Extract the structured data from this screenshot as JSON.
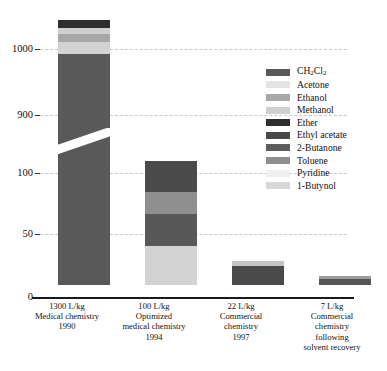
{
  "chart_data": {
    "type": "bar",
    "title": "",
    "subtitle": "",
    "xlabel": "",
    "ylabel": "",
    "stacked": true,
    "grid": true,
    "legend_position": "right",
    "broken_axis": true,
    "axis_note": "Y axis is broken: lower segment spans 0-100, upper segment spans 900-1050",
    "ylim_lower": [
      0,
      100
    ],
    "ylim_upper": [
      900,
      1050
    ],
    "ytick_labels": [
      "1000",
      "900",
      "100",
      "50",
      "0"
    ],
    "ytick_values": [
      1000,
      900,
      100,
      50,
      0
    ],
    "categories": [
      "1300 L/kg Medical chemistry 1990",
      "100 L/kg Optimized medical chemistry 1994",
      "22 L/kg Commercial chemistry 1997",
      "7 L/kg Commercial chemistry following solvent recovery"
    ],
    "category_totals": [
      1300,
      100,
      22,
      7
    ],
    "units": "L/kg",
    "series": [
      {
        "name": "CH2Cl2",
        "label": "CH₂Cl₂",
        "color": "#595959",
        "values": [
          1000,
          0,
          18,
          0
        ]
      },
      {
        "name": "Acetone",
        "label": "Acetone",
        "color": "#e2e2e2",
        "values": [
          22,
          0,
          0,
          0
        ]
      },
      {
        "name": "Ethanol",
        "label": "Ethanol",
        "color": "#a8a8a8",
        "values": [
          40,
          0,
          0,
          0
        ]
      },
      {
        "name": "Methanol",
        "label": "Methanol",
        "color": "#cfcfcf",
        "values": [
          30,
          0,
          0,
          0
        ]
      },
      {
        "name": "Ether",
        "label": "Ether",
        "color": "#2e2e2e",
        "values": [
          20,
          0,
          0,
          0
        ]
      },
      {
        "name": "Ethyl acetate",
        "label": "Ethyl acetate",
        "color": "#4a4a4a",
        "values": [
          0,
          24,
          0,
          7
        ]
      },
      {
        "name": "2-Butanone",
        "label": "2-Butanone",
        "color": "#626262",
        "values": [
          0,
          0,
          0,
          0
        ]
      },
      {
        "name": "Toluene",
        "label": "Toluene",
        "color": "#8f8f8f",
        "values": [
          0,
          17,
          0,
          0
        ]
      },
      {
        "name": "Pyridine",
        "label": "Pyridine",
        "color": "#efefef",
        "values": [
          0,
          0,
          0,
          0
        ]
      },
      {
        "name": "1-Butynol",
        "label": "1-Butynol",
        "color": "#d8d8d8",
        "values": [
          0,
          30,
          4,
          0
        ]
      }
    ]
  },
  "yaxis": {
    "ticks": [
      {
        "label": "1000",
        "y": 49
      },
      {
        "label": "900",
        "y": 115
      },
      {
        "label": "100",
        "y": 173
      },
      {
        "label": "50",
        "y": 234
      },
      {
        "label": "0",
        "y": 297
      }
    ]
  },
  "bars": [
    {
      "name": "bar-1990",
      "left": 18,
      "width": 52,
      "bottom": 0,
      "top": 20,
      "segments": [
        {
          "series": "Ether",
          "color": "#2e2e2e",
          "top": 20,
          "height": 8
        },
        {
          "series": "Methanol",
          "color": "#cfcfcf",
          "top": 28,
          "height": 6
        },
        {
          "series": "Ethanol",
          "color": "#a8a8a8",
          "top": 34,
          "height": 8
        },
        {
          "series": "Acetone",
          "color": "#d3d3d3",
          "top": 42,
          "height": 12
        },
        {
          "series": "CH2Cl2",
          "color": "#595959",
          "top": 54,
          "height": 231
        }
      ]
    },
    {
      "name": "bar-1994",
      "left": 105,
      "width": 52,
      "bottom": 0,
      "top": 161,
      "segments": [
        {
          "series": "Ethyl acetate",
          "color": "#4a4a4a",
          "top": 161,
          "height": 31
        },
        {
          "series": "Toluene",
          "color": "#8f8f8f",
          "top": 192,
          "height": 22
        },
        {
          "series": "2-Butanone",
          "color": "#585858",
          "top": 214,
          "height": 32
        },
        {
          "series": "1-Butynol",
          "color": "#d3d3d3",
          "top": 246,
          "height": 39
        }
      ]
    },
    {
      "name": "bar-1997",
      "left": 192,
      "width": 52,
      "bottom": 0,
      "top": 261,
      "segments": [
        {
          "series": "1-Butynol",
          "color": "#c4c4c4",
          "top": 261,
          "height": 5
        },
        {
          "series": "CH2Cl2",
          "color": "#4a4a4a",
          "top": 266,
          "height": 19
        }
      ]
    },
    {
      "name": "bar-recovery",
      "left": 279,
      "width": 52,
      "bottom": 0,
      "top": 276,
      "segments": [
        {
          "series": "Toluene",
          "color": "#9a9a9a",
          "top": 276,
          "height": 3
        },
        {
          "series": "CH2Cl2",
          "color": "#555555",
          "top": 279,
          "height": 6
        }
      ]
    }
  ],
  "gridlines": [
    49,
    115,
    173,
    234
  ],
  "xlabels": [
    {
      "name": "xlabel-1990",
      "left": 24,
      "width": 86,
      "lines": [
        "1300 L/kg",
        "Medical chemistry",
        "1990"
      ]
    },
    {
      "name": "xlabel-1994",
      "left": 108,
      "width": 92,
      "lines": [
        "100 L/kg",
        "Optimized",
        "medical chemistry",
        "1994"
      ]
    },
    {
      "name": "xlabel-1997",
      "left": 198,
      "width": 86,
      "lines": [
        "22 L/kg",
        "Commercial",
        "chemistry",
        "1997"
      ]
    },
    {
      "name": "xlabel-recovery",
      "left": 280,
      "width": 104,
      "lines": [
        "7 L/kg",
        "Commercial",
        "chemistry",
        "following",
        "solvent recovery"
      ]
    }
  ],
  "legend": {
    "items": [
      {
        "label": "CH2Cl2",
        "html_label": "CH₂Cl₂",
        "color": "#595959"
      },
      {
        "label": "Acetone",
        "html_label": "Acetone",
        "color": "#e4e4e4"
      },
      {
        "label": "Ethanol",
        "html_label": "Ethanol",
        "color": "#a8a8a8"
      },
      {
        "label": "Methanol",
        "html_label": "Methanol",
        "color": "#cfcfcf"
      },
      {
        "label": "Ether",
        "html_label": "Ether",
        "color": "#2e2e2e"
      },
      {
        "label": "Ethyl acetate",
        "html_label": "Ethyl acetate",
        "color": "#4a4a4a"
      },
      {
        "label": "2-Butanone",
        "html_label": "2-Butanone",
        "color": "#5e5e5e"
      },
      {
        "label": "Toluene",
        "html_label": "Toluene",
        "color": "#8f8f8f"
      },
      {
        "label": "Pyridine",
        "html_label": "Pyridine",
        "color": "#efefef"
      },
      {
        "label": "1-Butynol",
        "html_label": "1-Butynol",
        "color": "#d8d8d8"
      }
    ]
  }
}
